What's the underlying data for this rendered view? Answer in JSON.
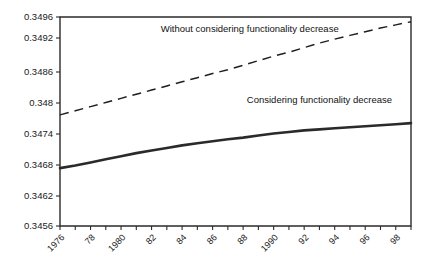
{
  "chart_data": {
    "type": "line",
    "title": "",
    "xlabel": "",
    "ylabel": "",
    "xlim": [
      1976,
      1999
    ],
    "ylim": [
      0.3456,
      0.3496
    ],
    "grid": false,
    "legend_position": "inline-annotations",
    "x": [
      1976,
      1977,
      1978,
      1979,
      1980,
      1981,
      1982,
      1983,
      1984,
      1985,
      1986,
      1987,
      1988,
      1989,
      1990,
      1991,
      1992,
      1993,
      1994,
      1995,
      1996,
      1997,
      1998,
      1999
    ],
    "xtick_labels": [
      "1976",
      "",
      "78",
      "",
      "1980",
      "",
      "82",
      "",
      "84",
      "",
      "86",
      "",
      "88",
      "",
      "1990",
      "",
      "92",
      "",
      "94",
      "",
      "96",
      "",
      "98",
      ""
    ],
    "ytick_labels": [
      "0.3456",
      "0.3462",
      "0.3468",
      "0.3474",
      "0.348",
      "0.3486",
      "0.3492",
      "0.3496"
    ],
    "ytick_values": [
      0.3456,
      0.3462,
      0.3468,
      0.3474,
      0.348,
      0.3486,
      0.3492,
      0.3496
    ],
    "series": [
      {
        "name": "Without considering functionality decrease",
        "style": "dashed",
        "color": "#1f1f1f",
        "annotation": "Without considering functionality decrease",
        "values": [
          0.34777,
          0.34785,
          0.34793,
          0.34801,
          0.34809,
          0.34817,
          0.34825,
          0.34833,
          0.34841,
          0.34849,
          0.34857,
          0.34864,
          0.34872,
          0.3488,
          0.34888,
          0.34895,
          0.34903,
          0.34911,
          0.34918,
          0.34925,
          0.34932,
          0.34939,
          0.34945,
          0.34951
        ]
      },
      {
        "name": "Considering functionality decrease",
        "style": "solid",
        "color": "#2a2a2a",
        "annotation": "Considering functionality decrease",
        "values": [
          0.34674,
          0.34679,
          0.34685,
          0.34691,
          0.34697,
          0.34703,
          0.34708,
          0.34713,
          0.34718,
          0.34722,
          0.34726,
          0.3473,
          0.34733,
          0.34737,
          0.34741,
          0.34744,
          0.34747,
          0.34749,
          0.34751,
          0.34753,
          0.34755,
          0.34757,
          0.34759,
          0.34761
        ]
      }
    ],
    "annotations": [
      {
        "text": "Without considering functionality decrease",
        "x": 1982.6,
        "y": 0.34932
      },
      {
        "text": "Considering functionality decrease",
        "x": 1993.0,
        "y": 0.348
      }
    ]
  }
}
